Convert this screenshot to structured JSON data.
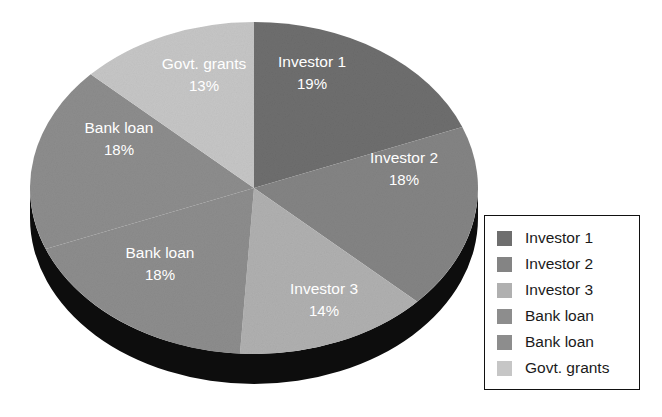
{
  "chart_data": {
    "type": "pie",
    "title": "",
    "subtitle": "",
    "xlabel": "",
    "ylabel": "",
    "grid": false,
    "legend_position": "right",
    "style": "3d-pie-grayscale",
    "start_angle_deg": 0,
    "direction": "clockwise",
    "categories": [
      "Investor 1",
      "Investor 2",
      "Investor 3",
      "Bank loan",
      "Bank loan",
      "Govt. grants"
    ],
    "values": [
      19,
      18,
      14,
      18,
      18,
      13
    ],
    "value_unit": "%",
    "colors": [
      "#6e6e6e",
      "#848484",
      "#b0b0b0",
      "#8d8d8d",
      "#8d8d8d",
      "#c6c6c6"
    ],
    "base_color": "#0d0d0d",
    "label_color": "#ffffff",
    "slices": [
      {
        "name": "Investor 1",
        "value": 19,
        "label": "Investor 1",
        "pct_label": "19%",
        "color": "#6e6e6e"
      },
      {
        "name": "Investor 2",
        "value": 18,
        "label": "Investor 2",
        "pct_label": "18%",
        "color": "#848484"
      },
      {
        "name": "Investor 3",
        "value": 14,
        "label": "Investor 3",
        "pct_label": "14%",
        "color": "#b0b0b0"
      },
      {
        "name": "Bank loan A",
        "value": 18,
        "label": "Bank loan",
        "pct_label": "18%",
        "color": "#8d8d8d"
      },
      {
        "name": "Bank loan B",
        "value": 18,
        "label": "Bank loan",
        "pct_label": "18%",
        "color": "#8d8d8d"
      },
      {
        "name": "Govt. grants",
        "value": 13,
        "label": "Govt. grants",
        "pct_label": "13%",
        "color": "#c6c6c6"
      }
    ]
  },
  "labels": {
    "investor1": {
      "name": "Investor 1",
      "pct": "19%"
    },
    "investor2": {
      "name": "Investor 2",
      "pct": "18%"
    },
    "investor3": {
      "name": "Investor 3",
      "pct": "14%"
    },
    "bankloan_upper": {
      "name": "Bank loan",
      "pct": "18%"
    },
    "bankloan_lower": {
      "name": "Bank loan",
      "pct": "18%"
    },
    "govtgrants": {
      "name": "Govt. grants",
      "pct": "13%"
    }
  },
  "legend": {
    "items": [
      {
        "label": "Investor 1",
        "color": "#6e6e6e"
      },
      {
        "label": "Investor 2",
        "color": "#848484"
      },
      {
        "label": "Investor 3",
        "color": "#b0b0b0"
      },
      {
        "label": "Bank loan",
        "color": "#8d8d8d"
      },
      {
        "label": "Bank loan",
        "color": "#8d8d8d"
      },
      {
        "label": "Govt. grants",
        "color": "#c6c6c6"
      }
    ]
  }
}
